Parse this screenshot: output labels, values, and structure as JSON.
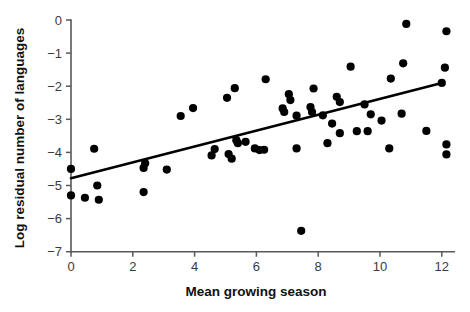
{
  "figure": {
    "background": "#ffffff",
    "point_color": "#000000",
    "line_color": "#000000",
    "axis_color": "#58595b"
  },
  "chart_data": {
    "type": "scatter",
    "title": "",
    "subtitle": "",
    "xlabel": "Mean growing season",
    "ylabel": "Log residual number of languages",
    "xlim": [
      0,
      12.4
    ],
    "ylim": [
      -7,
      0
    ],
    "xticks": [
      0,
      2,
      4,
      6,
      8,
      10,
      12
    ],
    "xtick_labels": [
      "0",
      "2",
      "4",
      "6",
      "8",
      "10",
      "12"
    ],
    "yticks": [
      0,
      -1,
      -2,
      -3,
      -4,
      -5,
      -6,
      -7
    ],
    "ytick_labels": [
      "0",
      "−1",
      "−2",
      "−3",
      "−4",
      "−5",
      "−6",
      "−7"
    ],
    "grid": false,
    "legend": null,
    "marker": "filled-circle",
    "marker_size_px": 7,
    "points": [
      {
        "x": 0.0,
        "y": -4.5
      },
      {
        "x": 0.0,
        "y": -5.3
      },
      {
        "x": 0.45,
        "y": -5.37
      },
      {
        "x": 0.75,
        "y": -3.89
      },
      {
        "x": 0.85,
        "y": -5.0
      },
      {
        "x": 0.9,
        "y": -5.43
      },
      {
        "x": 2.35,
        "y": -4.47
      },
      {
        "x": 2.35,
        "y": -5.2
      },
      {
        "x": 2.4,
        "y": -4.33
      },
      {
        "x": 3.1,
        "y": -4.52
      },
      {
        "x": 3.55,
        "y": -2.9
      },
      {
        "x": 3.95,
        "y": -2.66
      },
      {
        "x": 4.55,
        "y": -4.09
      },
      {
        "x": 4.65,
        "y": -3.9
      },
      {
        "x": 5.05,
        "y": -2.35
      },
      {
        "x": 5.1,
        "y": -4.05
      },
      {
        "x": 5.2,
        "y": -4.19
      },
      {
        "x": 5.3,
        "y": -2.06
      },
      {
        "x": 5.35,
        "y": -3.63
      },
      {
        "x": 5.4,
        "y": -3.72
      },
      {
        "x": 5.65,
        "y": -3.68
      },
      {
        "x": 5.95,
        "y": -3.88
      },
      {
        "x": 6.1,
        "y": -3.93
      },
      {
        "x": 6.25,
        "y": -3.92
      },
      {
        "x": 6.3,
        "y": -1.79
      },
      {
        "x": 6.85,
        "y": -2.67
      },
      {
        "x": 6.9,
        "y": -2.78
      },
      {
        "x": 7.05,
        "y": -2.24
      },
      {
        "x": 7.1,
        "y": -2.42
      },
      {
        "x": 7.3,
        "y": -2.89
      },
      {
        "x": 7.3,
        "y": -3.88
      },
      {
        "x": 7.45,
        "y": -6.37
      },
      {
        "x": 7.75,
        "y": -2.63
      },
      {
        "x": 7.8,
        "y": -2.78
      },
      {
        "x": 7.85,
        "y": -2.07
      },
      {
        "x": 8.15,
        "y": -2.88
      },
      {
        "x": 8.3,
        "y": -3.72
      },
      {
        "x": 8.45,
        "y": -3.13
      },
      {
        "x": 8.6,
        "y": -2.32
      },
      {
        "x": 8.7,
        "y": -2.48
      },
      {
        "x": 8.7,
        "y": -3.42
      },
      {
        "x": 9.05,
        "y": -1.41
      },
      {
        "x": 9.25,
        "y": -3.36
      },
      {
        "x": 9.5,
        "y": -2.55
      },
      {
        "x": 9.6,
        "y": -3.36
      },
      {
        "x": 9.7,
        "y": -2.85
      },
      {
        "x": 10.05,
        "y": -3.04
      },
      {
        "x": 10.3,
        "y": -3.88
      },
      {
        "x": 10.35,
        "y": -1.77
      },
      {
        "x": 10.7,
        "y": -2.83
      },
      {
        "x": 10.75,
        "y": -1.31
      },
      {
        "x": 10.85,
        "y": -0.12
      },
      {
        "x": 11.5,
        "y": -3.35
      },
      {
        "x": 12.0,
        "y": -1.9
      },
      {
        "x": 12.1,
        "y": -1.44
      },
      {
        "x": 12.15,
        "y": -0.34
      },
      {
        "x": 12.15,
        "y": -3.76
      },
      {
        "x": 12.15,
        "y": -4.06
      }
    ],
    "fit_line": {
      "label": "regression line",
      "x_start": 0.0,
      "y_start": -4.78,
      "x_end": 12.0,
      "y_end": -1.9
    }
  }
}
